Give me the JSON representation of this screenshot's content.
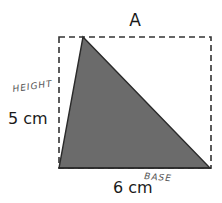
{
  "diagram": {
    "title": "A",
    "height_value": "5 cm",
    "base_value": "6 cm",
    "height_annotation": "HEIGHT",
    "base_annotation": "BASE",
    "colors": {
      "triangle_fill": "#6b6b6b",
      "outline": "#2a2a2a",
      "dashed_rect": "#333333"
    }
  }
}
